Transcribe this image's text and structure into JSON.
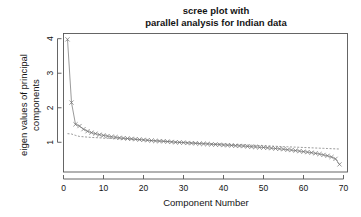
{
  "chart_data": {
    "type": "line",
    "title": "scree plot with\nparallel analysis for Indian data",
    "title_line1": "scree plot with",
    "title_line2": "parallel analysis for Indian data",
    "xlabel": "Component Number",
    "ylabel": "eigen values of principal components",
    "ylabel_line1": "eigen values of principal",
    "ylabel_line2": "components",
    "xlim": [
      0,
      71
    ],
    "ylim": [
      0.14,
      4.15
    ],
    "xticks": [
      0,
      10,
      20,
      30,
      40,
      50,
      60,
      70
    ],
    "yticks": [
      1,
      2,
      3,
      4
    ],
    "grid": false,
    "legend": "none",
    "marker": "x",
    "series": [
      {
        "name": "PC Actual Data",
        "style": "solid-with-x-markers",
        "x": [
          1,
          2,
          3,
          4,
          5,
          6,
          7,
          8,
          9,
          10,
          11,
          12,
          13,
          14,
          15,
          16,
          17,
          18,
          19,
          20,
          21,
          22,
          23,
          24,
          25,
          26,
          27,
          28,
          29,
          30,
          31,
          32,
          33,
          34,
          35,
          36,
          37,
          38,
          39,
          40,
          41,
          42,
          43,
          44,
          45,
          46,
          47,
          48,
          49,
          50,
          51,
          52,
          53,
          54,
          55,
          56,
          57,
          58,
          59,
          60,
          61,
          62,
          63,
          64,
          65,
          66,
          67,
          68,
          69
        ],
        "values": [
          3.98,
          2.15,
          1.52,
          1.47,
          1.38,
          1.32,
          1.28,
          1.25,
          1.22,
          1.2,
          1.18,
          1.16,
          1.15,
          1.13,
          1.12,
          1.11,
          1.1,
          1.09,
          1.08,
          1.07,
          1.06,
          1.05,
          1.04,
          1.035,
          1.03,
          1.02,
          1.01,
          1.0,
          0.995,
          0.99,
          0.98,
          0.975,
          0.97,
          0.96,
          0.955,
          0.95,
          0.94,
          0.935,
          0.93,
          0.92,
          0.915,
          0.91,
          0.9,
          0.895,
          0.89,
          0.88,
          0.87,
          0.865,
          0.855,
          0.85,
          0.84,
          0.83,
          0.82,
          0.81,
          0.8,
          0.785,
          0.775,
          0.76,
          0.745,
          0.73,
          0.715,
          0.7,
          0.68,
          0.66,
          0.635,
          0.61,
          0.575,
          0.52,
          0.36
        ]
      },
      {
        "name": "Simulated Data (parallel analysis)",
        "style": "dashed",
        "x": [
          1,
          2,
          3,
          4,
          5,
          6,
          7,
          8,
          9,
          10,
          11,
          12,
          13,
          14,
          15,
          16,
          17,
          18,
          19,
          20,
          21,
          22,
          23,
          24,
          25,
          26,
          27,
          28,
          29,
          30,
          31,
          32,
          33,
          34,
          35,
          36,
          37,
          38,
          39,
          40,
          41,
          42,
          43,
          44,
          45,
          46,
          47,
          48,
          49,
          50,
          51,
          52,
          53,
          54,
          55,
          56,
          57,
          58,
          59,
          60,
          61,
          62,
          63,
          64,
          65,
          66,
          67,
          68,
          69
        ],
        "values": [
          1.25,
          1.24,
          1.2,
          1.17,
          1.16,
          1.15,
          1.14,
          1.135,
          1.13,
          1.12,
          1.115,
          1.11,
          1.105,
          1.1,
          1.095,
          1.09,
          1.085,
          1.08,
          1.07,
          1.065,
          1.06,
          1.05,
          1.045,
          1.04,
          1.035,
          1.03,
          1.02,
          1.015,
          1.01,
          1.0,
          0.995,
          0.99,
          0.985,
          0.98,
          0.975,
          0.97,
          0.965,
          0.96,
          0.955,
          0.95,
          0.945,
          0.94,
          0.935,
          0.93,
          0.925,
          0.92,
          0.915,
          0.91,
          0.905,
          0.9,
          0.895,
          0.89,
          0.885,
          0.88,
          0.875,
          0.87,
          0.865,
          0.86,
          0.855,
          0.85,
          0.845,
          0.84,
          0.835,
          0.83,
          0.825,
          0.82,
          0.815,
          0.81,
          0.805
        ]
      }
    ],
    "colors": {
      "line": "#6e6e6e",
      "axis": "#555555",
      "text": "#141414",
      "background": "#ffffff"
    }
  }
}
